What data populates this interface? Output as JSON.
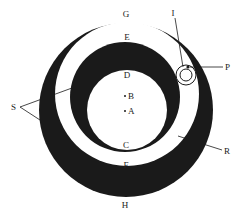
{
  "diagram": {
    "colors": {
      "ink": "#1a1a1a",
      "paper": "#ffffff"
    },
    "labels": {
      "G": "G",
      "E": "E",
      "D": "D",
      "B": "B",
      "A": "A",
      "C": "C",
      "F": "F",
      "H": "H",
      "I": "I",
      "P": "P",
      "S": "S",
      "R": "R"
    }
  }
}
